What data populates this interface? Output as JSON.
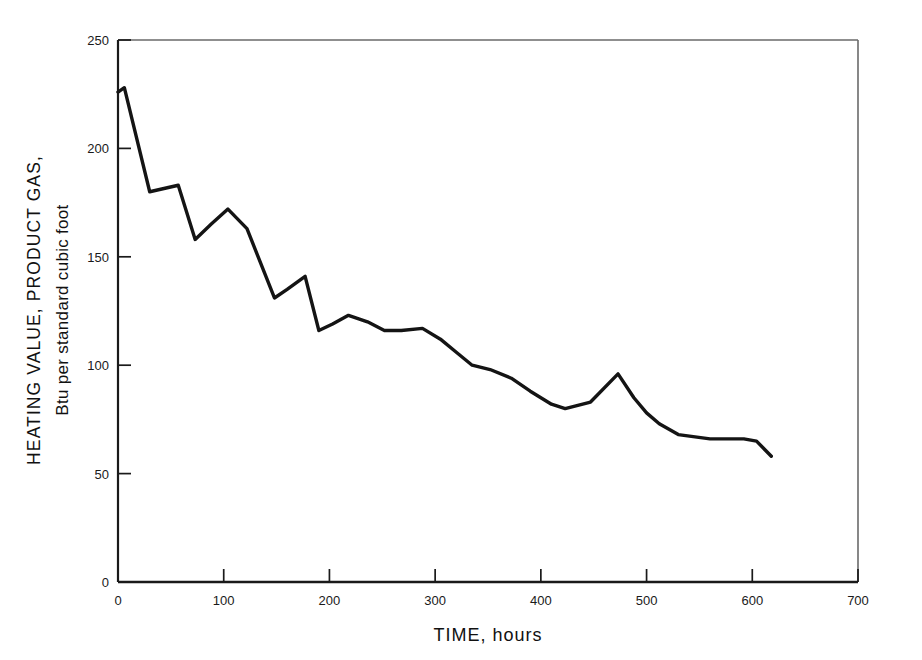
{
  "chart_data": {
    "type": "line",
    "title": "",
    "xlabel": "TIME, hours",
    "ylabel_line1": "HEATING VALUE, PRODUCT GAS,",
    "ylabel_line2": "Btu per standard cubic foot",
    "xlim": [
      0,
      700
    ],
    "ylim": [
      0,
      250
    ],
    "xticks": [
      0,
      100,
      200,
      300,
      400,
      500,
      600,
      700
    ],
    "yticks": [
      0,
      50,
      100,
      150,
      200,
      250
    ],
    "xtick_labels": [
      "0",
      "100",
      "200",
      "300",
      "400",
      "500",
      "600",
      "700"
    ],
    "ytick_labels": [
      "0",
      "50",
      "100",
      "150",
      "200",
      "250"
    ],
    "grid": false,
    "legend": "none",
    "series": [
      {
        "name": "Heating value of product gas",
        "color": "#141414",
        "x": [
          0,
          6,
          30,
          57,
          73,
          88,
          104,
          122,
          148,
          160,
          177,
          190,
          203,
          218,
          236,
          252,
          268,
          288,
          305,
          320,
          335,
          352,
          372,
          390,
          410,
          423,
          447,
          473,
          488,
          500,
          512,
          530,
          560,
          592,
          604,
          618
        ],
        "y": [
          226,
          228,
          180,
          183,
          158,
          165,
          172,
          163,
          131,
          135,
          141,
          116,
          119,
          123,
          120,
          116,
          116,
          117,
          112,
          106,
          100,
          98,
          94,
          88,
          82,
          80,
          83,
          96,
          85,
          78,
          73,
          68,
          66,
          66,
          65,
          58
        ]
      }
    ]
  },
  "axis": {
    "tick_color": "#1a1a1a",
    "frame_color": "#5a5a5a",
    "line_color": "#141414"
  }
}
